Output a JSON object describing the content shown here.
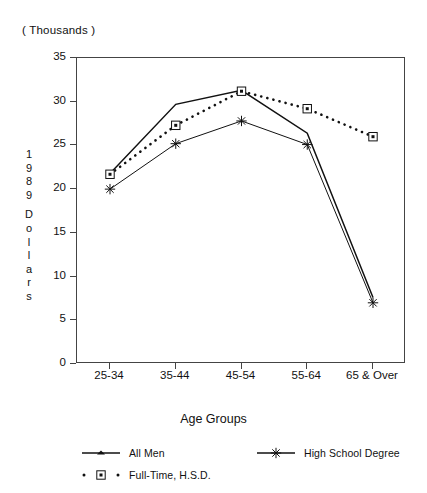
{
  "units_note": "( Thousands )",
  "axes": {
    "y_title_chars": [
      "1",
      "9",
      "8",
      "9",
      "",
      "D",
      "o",
      "l",
      "l",
      "a",
      "r",
      "s"
    ],
    "y_ticks": [
      "35",
      "30",
      "25",
      "20",
      "15",
      "10",
      "5",
      "0"
    ],
    "x_title": "Age Groups",
    "x_ticks": [
      "25-34",
      "35-44",
      "45-54",
      "55-64",
      "65 & Over"
    ]
  },
  "legend": {
    "items": [
      {
        "label": "All Men",
        "marker": "line-plain",
        "line": "solid"
      },
      {
        "label": "High School Degree",
        "marker": "star",
        "line": "solid"
      },
      {
        "label": "Full-Time, H.S.D.",
        "marker": "boxed-dot",
        "line": "dotted"
      }
    ]
  },
  "chart_data": {
    "type": "line",
    "title": "",
    "subtitle": "( Thousands )",
    "xlabel": "Age Groups",
    "ylabel": "1989 Dollars",
    "ylim": [
      0,
      35
    ],
    "yticks": [
      0,
      5,
      10,
      15,
      20,
      25,
      30,
      35
    ],
    "grid": false,
    "legend_position": "bottom",
    "categories": [
      "25-34",
      "35-44",
      "45-54",
      "55-64",
      "65 & Over"
    ],
    "series": [
      {
        "name": "All Men",
        "style": "solid",
        "marker": "none",
        "values": [
          21.8,
          29.7,
          31.3,
          26.4,
          7.6
        ]
      },
      {
        "name": "High School Degree",
        "style": "solid",
        "marker": "star",
        "values": [
          20.0,
          25.2,
          27.8,
          25.1,
          7.0
        ]
      },
      {
        "name": "Full-Time, H.S.D.",
        "style": "dotted",
        "marker": "boxed-dot",
        "values": [
          21.7,
          27.3,
          31.2,
          29.2,
          26.0
        ]
      }
    ]
  }
}
